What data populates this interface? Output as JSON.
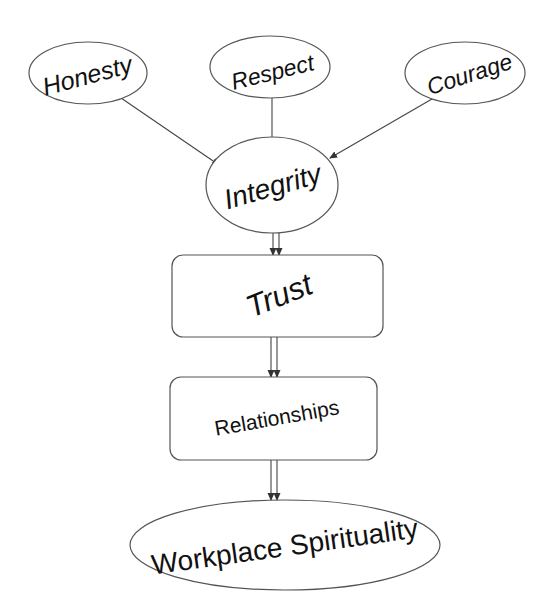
{
  "diagram": {
    "type": "flowchart",
    "nodes": [
      {
        "id": "honesty",
        "label": "Honesty",
        "shape": "ellipse"
      },
      {
        "id": "respect",
        "label": "Respect",
        "shape": "ellipse"
      },
      {
        "id": "courage",
        "label": "Courage",
        "shape": "ellipse"
      },
      {
        "id": "integrity",
        "label": "Integrity",
        "shape": "ellipse"
      },
      {
        "id": "trust",
        "label": "Trust",
        "shape": "rounded-rectangle"
      },
      {
        "id": "relationships",
        "label": "Relationships",
        "shape": "rounded-rectangle"
      },
      {
        "id": "workplace_spirituality",
        "label": "Workplace Spirituality",
        "shape": "ellipse"
      }
    ],
    "edges": [
      {
        "from": "honesty",
        "to": "integrity",
        "style": "single-arrow"
      },
      {
        "from": "respect",
        "to": "integrity",
        "style": "single-arrow"
      },
      {
        "from": "courage",
        "to": "integrity",
        "style": "single-arrow"
      },
      {
        "from": "integrity",
        "to": "trust",
        "style": "double-arrow"
      },
      {
        "from": "trust",
        "to": "relationships",
        "style": "double-arrow"
      },
      {
        "from": "relationships",
        "to": "workplace_spirituality",
        "style": "double-arrow"
      }
    ]
  },
  "labels": {
    "honesty": "Honesty",
    "respect": "Respect",
    "courage": "Courage",
    "integrity": "Integrity",
    "trust": "Trust",
    "relationships": "Relationships",
    "workplace_spirituality": "Workplace Spirituality"
  },
  "colors": {
    "stroke": "#555555",
    "text": "#111111",
    "background": "#ffffff"
  }
}
